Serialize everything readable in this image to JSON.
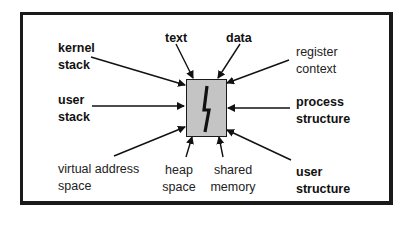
{
  "diagram": {
    "title": "",
    "center": {
      "name": "process",
      "icon": "lightning-bolt-icon",
      "fill": "#c4c4c4"
    },
    "labels": {
      "kernel_stack": [
        "kernel",
        "stack"
      ],
      "text": "text",
      "data": "data",
      "register_context": [
        "register",
        "context"
      ],
      "user_stack": [
        "user",
        "stack"
      ],
      "process_structure": [
        "process",
        "structure"
      ],
      "virtual_address_space": [
        "virtual address",
        "space"
      ],
      "heap_space": [
        "heap",
        "space"
      ],
      "shared_memory": [
        "shared",
        "memory"
      ],
      "user_structure": [
        "user",
        "structure"
      ]
    },
    "edges": [
      {
        "from": "kernel stack",
        "to": "process"
      },
      {
        "from": "text",
        "to": "process"
      },
      {
        "from": "data",
        "to": "process"
      },
      {
        "from": "register context",
        "to": "process"
      },
      {
        "from": "user stack",
        "to": "process"
      },
      {
        "from": "process structure",
        "to": "process"
      },
      {
        "from": "virtual address space",
        "to": "process"
      },
      {
        "from": "heap space",
        "to": "process"
      },
      {
        "from": "shared memory",
        "to": "process"
      },
      {
        "from": "user structure",
        "to": "process"
      }
    ]
  }
}
